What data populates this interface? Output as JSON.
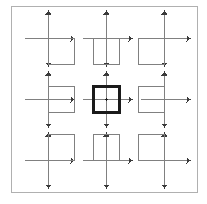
{
  "figure": {
    "type": "diagram",
    "canvas": {
      "width": 207,
      "height": 204,
      "background": "#ffffff"
    },
    "border": {
      "label": "outer frame",
      "x": 11,
      "y": 6,
      "width": 186,
      "height": 186,
      "stroke": "#b0b0b0",
      "stroke_width": 1,
      "fill": "none"
    },
    "style": {
      "axis_color": "#808080",
      "axis_width": 1,
      "square_color": "#808080",
      "square_width": 1.2,
      "highlight_color": "#1a1a1a",
      "highlight_width": 2.4,
      "arrow_color": "#3a3a3a",
      "arrow_size": 3
    },
    "grid": {
      "rows": 3,
      "cols": 3,
      "cell_size": 58,
      "origin_x": 20,
      "origin_y": 15,
      "gap": 4
    },
    "cells": [
      {
        "id": "cell-r1c1",
        "name": "axes-square-below-right",
        "row": 1,
        "col": 1,
        "origin": {
          "x": 48,
          "y": 38
        },
        "square": {
          "x": 48,
          "y": 38,
          "size": 26
        },
        "anchor": "origin-at-top-left-corner",
        "quadrant": "IV",
        "highlight": false
      },
      {
        "id": "cell-r1c2",
        "name": "axes-square-below-centered",
        "row": 1,
        "col": 2,
        "origin": {
          "x": 106,
          "y": 38
        },
        "square": {
          "x": 93,
          "y": 38,
          "size": 26
        },
        "anchor": "origin-at-top-edge-midpoint",
        "quadrant": "III-IV",
        "highlight": false
      },
      {
        "id": "cell-r1c3",
        "name": "axes-square-below-left",
        "row": 1,
        "col": 3,
        "origin": {
          "x": 164,
          "y": 38
        },
        "square": {
          "x": 138,
          "y": 38,
          "size": 26
        },
        "anchor": "origin-at-top-right-corner",
        "quadrant": "III",
        "highlight": false
      },
      {
        "id": "cell-r2c1",
        "name": "axes-square-middle-right",
        "row": 2,
        "col": 1,
        "origin": {
          "x": 48,
          "y": 99
        },
        "square": {
          "x": 48,
          "y": 86,
          "size": 26
        },
        "anchor": "origin-at-left-edge-midpoint",
        "quadrant": "I-IV",
        "highlight": false
      },
      {
        "id": "cell-r2c2",
        "name": "axes-square-centered-origin",
        "row": 2,
        "col": 2,
        "origin": {
          "x": 106,
          "y": 99
        },
        "square": {
          "x": 93,
          "y": 86,
          "size": 26
        },
        "anchor": "origin-at-center",
        "quadrant": "all",
        "highlight": true
      },
      {
        "id": "cell-r2c3",
        "name": "axes-square-middle-left",
        "row": 2,
        "col": 3,
        "origin": {
          "x": 164,
          "y": 99
        },
        "square": {
          "x": 138,
          "y": 86,
          "size": 26
        },
        "anchor": "origin-at-right-edge-midpoint",
        "quadrant": "II-III",
        "highlight": false
      },
      {
        "id": "cell-r3c1",
        "name": "axes-square-above-right",
        "row": 3,
        "col": 1,
        "origin": {
          "x": 48,
          "y": 160
        },
        "square": {
          "x": 48,
          "y": 134,
          "size": 26
        },
        "anchor": "origin-at-bottom-left-corner",
        "quadrant": "I",
        "highlight": false
      },
      {
        "id": "cell-r3c2",
        "name": "axes-square-above-centered",
        "row": 3,
        "col": 2,
        "origin": {
          "x": 106,
          "y": 160
        },
        "square": {
          "x": 93,
          "y": 134,
          "size": 26
        },
        "anchor": "origin-at-bottom-edge-midpoint",
        "quadrant": "I-II",
        "highlight": false
      },
      {
        "id": "cell-r3c3",
        "name": "axes-square-above-left",
        "row": 3,
        "col": 3,
        "origin": {
          "x": 164,
          "y": 160
        },
        "square": {
          "x": 138,
          "y": 134,
          "size": 26
        },
        "anchor": "origin-at-bottom-right-corner",
        "quadrant": "II",
        "highlight": false
      }
    ],
    "axis_extents": {
      "x_left": 24,
      "x_right": 25,
      "y_up": 27,
      "y_down": 27
    }
  }
}
